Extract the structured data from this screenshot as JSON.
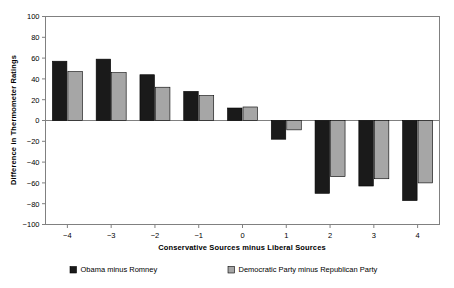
{
  "chart_data": {
    "type": "bar",
    "title": "",
    "xlabel": "Conservative Sources minus Liberal Sources",
    "ylabel": "Difference in Thermometer Ratings",
    "categories": [
      "-4",
      "-3",
      "-2",
      "-1",
      "0",
      "1",
      "2",
      "3",
      "4"
    ],
    "series": [
      {
        "name": "Obama minus Romney",
        "color": "#1a1a1a",
        "values": [
          57,
          59,
          44,
          28,
          12,
          -18,
          -70,
          -63,
          -77
        ]
      },
      {
        "name": "Democratic Party minus Republican Party",
        "color": "#a6a6a6",
        "values": [
          47,
          46,
          32,
          24,
          13,
          -9,
          -54,
          -56,
          -60
        ]
      }
    ],
    "ylim": [
      -100,
      100
    ],
    "ytick_step": 20,
    "yticks": [
      "100",
      "80",
      "60",
      "40",
      "20",
      "0",
      "-20",
      "-40",
      "-60",
      "-80",
      "-100"
    ],
    "grid": false,
    "legend_position": "bottom"
  },
  "legend": {
    "items": [
      {
        "label": "Obama minus Romney",
        "swatch": "#1a1a1a"
      },
      {
        "label": "Democratic Party minus Republican Party",
        "swatch": "#a6a6a6"
      }
    ]
  },
  "axis": {
    "y_title": "Difference in Thermometer Ratings",
    "x_title": "Conservative Sources minus Liberal Sources"
  }
}
